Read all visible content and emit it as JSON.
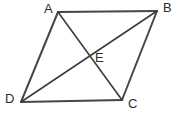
{
  "figure": {
    "kind": "geometry-diagram",
    "canvas": {
      "width": 180,
      "height": 116,
      "background": "#ffffff"
    },
    "style": {
      "edge_color": "#474747",
      "edge_width": 2,
      "diagonal_color": "#3c3c3c",
      "diagonal_width": 1.6,
      "label_color": "#2e2e2e",
      "label_font_size": 13
    },
    "points": [
      {
        "id": "A",
        "label": "A",
        "x": 58,
        "y": 12,
        "label_x": 44,
        "label_y": 2
      },
      {
        "id": "B",
        "label": "B",
        "x": 157,
        "y": 11,
        "label_x": 163,
        "label_y": 1
      },
      {
        "id": "C",
        "label": "C",
        "x": 122,
        "y": 100,
        "label_x": 128,
        "label_y": 97
      },
      {
        "id": "D",
        "label": "D",
        "x": 21,
        "y": 102,
        "label_x": 5,
        "label_y": 92
      },
      {
        "id": "E",
        "label": "E",
        "x": 89,
        "y": 56,
        "label_x": 95,
        "label_y": 51
      }
    ],
    "segments": [
      {
        "id": "AB",
        "from": "A",
        "to": "B",
        "role": "edge",
        "x1": 58,
        "y1": 12,
        "x2": 157,
        "y2": 11
      },
      {
        "id": "BC",
        "from": "B",
        "to": "C",
        "role": "edge",
        "x1": 157,
        "y1": 11,
        "x2": 122,
        "y2": 100
      },
      {
        "id": "CD",
        "from": "C",
        "to": "D",
        "role": "edge",
        "x1": 122,
        "y1": 100,
        "x2": 21,
        "y2": 102
      },
      {
        "id": "DA",
        "from": "D",
        "to": "A",
        "role": "edge",
        "x1": 21,
        "y1": 102,
        "x2": 58,
        "y2": 12
      },
      {
        "id": "AC",
        "from": "A",
        "to": "C",
        "role": "diagonal",
        "x1": 58,
        "y1": 12,
        "x2": 122,
        "y2": 100
      },
      {
        "id": "DB",
        "from": "D",
        "to": "B",
        "role": "diagonal",
        "x1": 21,
        "y1": 102,
        "x2": 157,
        "y2": 11
      }
    ]
  }
}
